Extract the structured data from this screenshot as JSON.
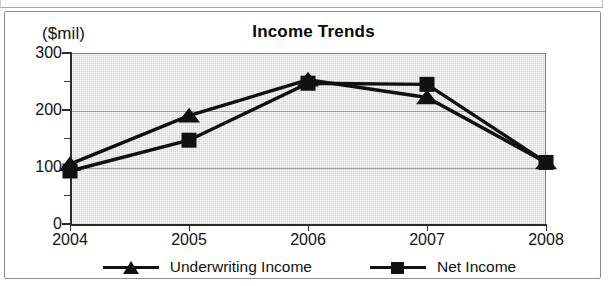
{
  "figure": {
    "title": "Income Trends",
    "unit_label": "($mil)"
  },
  "chart_data": {
    "type": "line",
    "title": "Income Trends",
    "xlabel": "",
    "ylabel": "($mil)",
    "categories": [
      "2004",
      "2005",
      "2006",
      "2007",
      "2008"
    ],
    "x": [
      2004,
      2005,
      2006,
      2007,
      2008
    ],
    "ylim": [
      0,
      300
    ],
    "yticks": [
      0,
      100,
      200,
      300
    ],
    "ytick_labels": [
      "0",
      "100",
      "200",
      "300"
    ],
    "yminor_ticks": [
      50,
      150,
      250
    ],
    "grid": true,
    "grid_axis": "y",
    "legend_position": "bottom",
    "plot_background": "#d7d7d7",
    "series": [
      {
        "name": "Underwriting Income",
        "marker": "triangle",
        "color": "#111111",
        "values": [
          105,
          190,
          253,
          222,
          108
        ]
      },
      {
        "name": "Net Income",
        "marker": "square",
        "color": "#111111",
        "values": [
          93,
          147,
          247,
          245,
          108
        ]
      }
    ]
  },
  "legend": {
    "items": [
      {
        "label": "Underwriting Income",
        "marker": "triangle-marker-icon"
      },
      {
        "label": "Net Income",
        "marker": "square-marker-icon"
      }
    ]
  }
}
